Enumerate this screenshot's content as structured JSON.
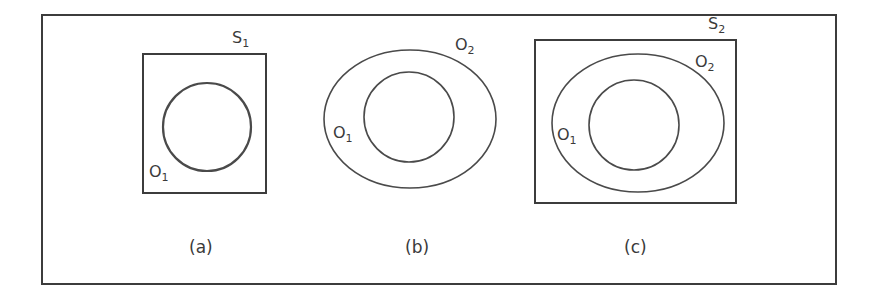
{
  "figure": {
    "panels": [
      {
        "id": "a",
        "caption": "(a)",
        "set_label": "S",
        "set_subscript": "1",
        "inner_label": "O",
        "inner_subscript": "1"
      },
      {
        "id": "b",
        "caption": "(b)",
        "outer_label": "O",
        "outer_subscript": "2",
        "inner_label": "O",
        "inner_subscript": "1"
      },
      {
        "id": "c",
        "caption": "(c)",
        "set_label": "S",
        "set_subscript": "2",
        "outer_label": "O",
        "outer_subscript": "2",
        "inner_label": "O",
        "inner_subscript": "1"
      }
    ],
    "colors": {
      "stroke": "#3c3c3c",
      "text": "#3a3a3a",
      "background": "#ffffff"
    }
  }
}
